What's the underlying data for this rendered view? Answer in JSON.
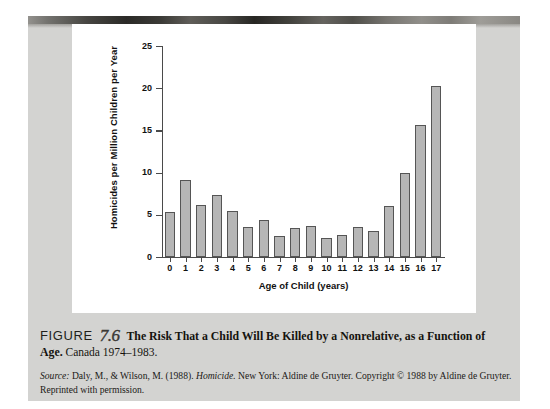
{
  "figure": {
    "label_word": "FIGURE",
    "number": "7.6",
    "title_bold_part1": "The Risk That a Child Will Be Killed by a Nonrelative, as a Function of",
    "title_bold_part2": "Age.",
    "title_rest": " Canada 1974–1983.",
    "source_prefix": "Source:",
    "source_text_1": " Daly, M., & Wilson, M. (1988). ",
    "source_italic": "Homicide.",
    "source_text_2": " New York: Aldine de Gruyter. Copyright © 1988 by Aldine de Gruyter. Reprinted with permission."
  },
  "chart_data": {
    "type": "bar",
    "title": "",
    "xlabel": "Age of Child (years)",
    "ylabel": "Homicides per Million Children per Year",
    "categories": [
      "0",
      "1",
      "2",
      "3",
      "4",
      "5",
      "6",
      "7",
      "8",
      "9",
      "10",
      "11",
      "12",
      "13",
      "14",
      "15",
      "16",
      "17"
    ],
    "values": [
      5.3,
      9.1,
      6.2,
      7.4,
      5.5,
      3.6,
      4.4,
      2.5,
      3.4,
      3.7,
      2.2,
      2.6,
      3.6,
      3.1,
      6.1,
      10.0,
      15.6,
      20.3
    ],
    "ylim": [
      0,
      25
    ],
    "yticks": [
      0,
      5,
      10,
      15,
      20,
      25
    ],
    "ytick_labels": [
      "0",
      "5",
      "10",
      "15",
      "20",
      "25"
    ],
    "grid": false,
    "legend": false,
    "bar_color": "#b6b6b6",
    "bar_edge_color": "#555555",
    "axis_color": "#4a4a4a",
    "panel_background": "#ffffff",
    "page_background": "#d3d3d1"
  }
}
